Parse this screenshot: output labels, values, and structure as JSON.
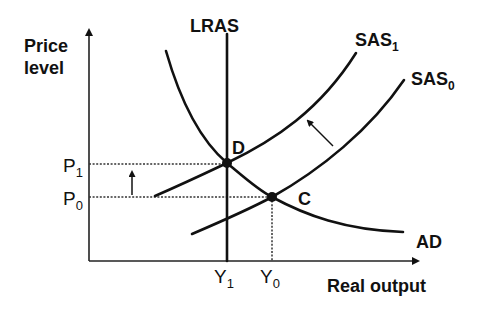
{
  "diagram": {
    "type": "AD-AS economics diagram",
    "y_axis_label_line1": "Price",
    "y_axis_label_line2": "level",
    "x_axis_label": "Real output",
    "curves": {
      "lras": "LRAS",
      "sas1": {
        "base": "SAS",
        "sub": "1"
      },
      "sas0": {
        "base": "SAS",
        "sub": "0"
      },
      "ad": "AD"
    },
    "points": {
      "d": "D",
      "c": "C"
    },
    "price_ticks": {
      "p1": {
        "base": "P",
        "sub": "1"
      },
      "p0": {
        "base": "P",
        "sub": "0"
      }
    },
    "output_ticks": {
      "y1": {
        "base": "Y",
        "sub": "1"
      },
      "y0": {
        "base": "Y",
        "sub": "0"
      }
    },
    "colors": {
      "line": "#111111",
      "background": "#ffffff"
    }
  }
}
